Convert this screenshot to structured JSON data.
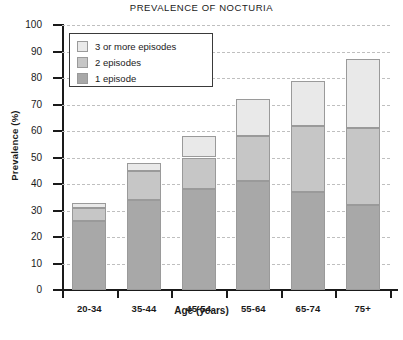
{
  "chart_data": {
    "type": "bar",
    "subtype": "stacked-vertical",
    "title": "PREVALENCE OF NOCTURIA",
    "xlabel": "Age (years)",
    "ylabel": "Prevalence (%)",
    "categories": [
      "20-34",
      "35-44",
      "45-54",
      "55-64",
      "65-74",
      "75+"
    ],
    "series": [
      {
        "name": "1 episode",
        "values": [
          26,
          34,
          38,
          41,
          37,
          32
        ],
        "color": "#a8a8a8"
      },
      {
        "name": "2 episodes",
        "values": [
          5,
          11,
          12,
          17,
          25,
          29
        ],
        "color": "#c6c6c6"
      },
      {
        "name": "3 or more episodes",
        "values": [
          2,
          3,
          8,
          14,
          17,
          26
        ],
        "color": "#e9e9e9"
      }
    ],
    "totals": [
      33,
      48,
      58,
      72,
      79,
      87
    ],
    "cumulative": {
      "one_episode": [
        26,
        34,
        38,
        41,
        37,
        32
      ],
      "through_two_episodes": [
        31,
        45,
        50,
        58,
        62,
        61
      ],
      "through_three_or_more": [
        33,
        48,
        58,
        72,
        79,
        87
      ]
    },
    "ylim": [
      0,
      100
    ],
    "ytick_labels": [
      "0",
      "10",
      "20",
      "30",
      "40",
      "50",
      "60",
      "70",
      "80",
      "90",
      "100"
    ],
    "ytick_values": [
      0,
      10,
      20,
      30,
      40,
      50,
      60,
      70,
      80,
      90,
      100
    ],
    "grid": true,
    "grid_style": "dashed-horizontal",
    "legend_position": "upper-left-inside",
    "legend_entries": [
      {
        "label": "3 or more episodes",
        "color": "#e9e9e9"
      },
      {
        "label": "2 episodes",
        "color": "#c6c6c6"
      },
      {
        "label": "1 episode",
        "color": "#a8a8a8"
      }
    ]
  },
  "caption": ""
}
